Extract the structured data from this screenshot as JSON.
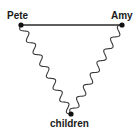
{
  "diagram": {
    "type": "relationship-triangle",
    "nodes": [
      {
        "id": "pete",
        "label": "Pete",
        "x": 21,
        "y": 25,
        "label_x": 7,
        "label_y": 19
      },
      {
        "id": "amy",
        "label": "Amy",
        "x": 122,
        "y": 25,
        "label_x": 111,
        "label_y": 19
      },
      {
        "id": "children",
        "label": "children",
        "x": 71,
        "y": 114,
        "label_x": 50,
        "label_y": 127
      }
    ],
    "edges": [
      {
        "from": "pete",
        "to": "amy",
        "style": "straight"
      },
      {
        "from": "pete",
        "to": "children",
        "style": "wavy"
      },
      {
        "from": "amy",
        "to": "children",
        "style": "wavy"
      }
    ],
    "colors": {
      "line": "#2a2a2a",
      "node": "#111111",
      "text": "#1a1a1a",
      "background": "#ffffff"
    }
  }
}
